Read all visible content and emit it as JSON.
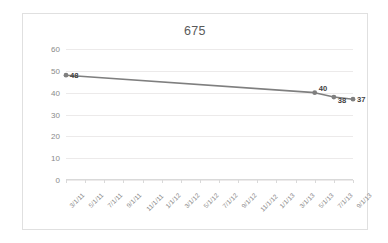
{
  "chart_data": {
    "type": "line",
    "title": "675",
    "xlabel": "",
    "ylabel": "",
    "ylim": [
      0,
      60
    ],
    "ytick_step": 10,
    "yticks": [
      "60",
      "50",
      "40",
      "30",
      "20",
      "10",
      "0"
    ],
    "grid": true,
    "legend": "none",
    "series_color": "#7f7f7f",
    "marker": "circle",
    "categories": [
      "3/1/11",
      "5/1/11",
      "7/1/11",
      "9/1/11",
      "11/1/11",
      "1/1/12",
      "3/1/12",
      "5/1/12",
      "7/1/12",
      "9/1/12",
      "11/1/12",
      "1/1/13",
      "3/1/13",
      "5/1/13",
      "7/1/13",
      "9/1/13"
    ],
    "series": [
      {
        "name": "675",
        "points": [
          {
            "x": "3/1/11",
            "y": 48,
            "label": "48"
          },
          {
            "x": "5/1/13",
            "y": 40,
            "label": "40"
          },
          {
            "x": "7/1/13",
            "y": 38,
            "label": "38"
          },
          {
            "x": "9/1/13",
            "y": 37,
            "label": "37"
          }
        ]
      }
    ],
    "data_labels": [
      "48",
      "40",
      "38",
      "37"
    ]
  },
  "colors": {
    "line": "#7f7f7f",
    "grid": "#eceaea",
    "axis": "#d9d9d9",
    "tick_text": "#8a8a8a",
    "title_text": "#5a5a5a",
    "frame_border": "#e0e0e0",
    "label_text": "#3f3f3f"
  }
}
